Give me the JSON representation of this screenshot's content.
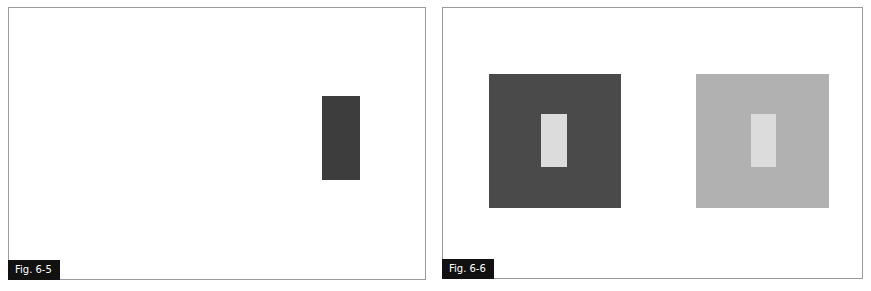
{
  "figures": [
    {
      "label": "Fig. 6-5",
      "shapes": [
        {
          "name": "dark-rectangle",
          "color": "#3d3d3d",
          "x": 313,
          "y": 88,
          "w": 38,
          "h": 84
        }
      ]
    },
    {
      "label": "Fig. 6-6",
      "shapes": [
        {
          "name": "dark-square",
          "color": "#4a4a4a",
          "x": 46,
          "y": 66,
          "w": 132,
          "h": 134
        },
        {
          "name": "light-inner-rectangle-on-dark",
          "color": "#dcdcdc",
          "x": 98,
          "y": 106,
          "w": 26,
          "h": 53
        },
        {
          "name": "light-gray-square",
          "color": "#b1b1b1",
          "x": 253,
          "y": 66,
          "w": 133,
          "h": 134
        },
        {
          "name": "light-inner-rectangle-on-light",
          "color": "#dcdcdc",
          "x": 308,
          "y": 106,
          "w": 25,
          "h": 53
        }
      ]
    }
  ],
  "colors": {
    "border": "#9a9a9a",
    "label_bg": "#111111",
    "label_text": "#ffffff"
  }
}
